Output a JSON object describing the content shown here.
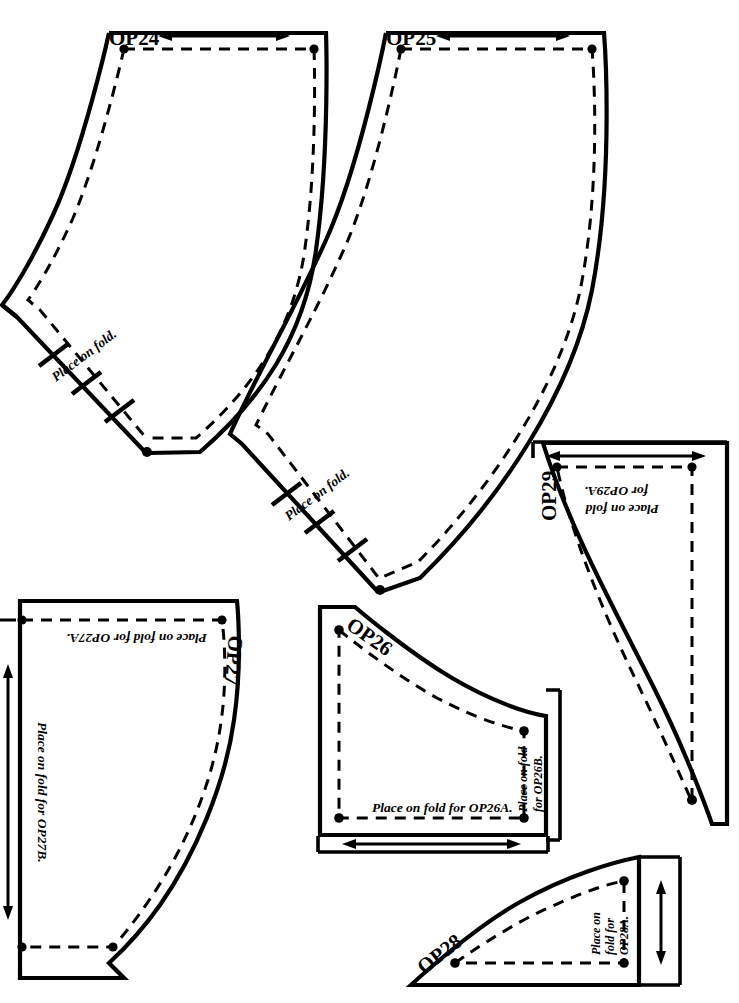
{
  "sheet": {
    "title": "Pattern piece layout sheet",
    "background_color": "#ffffff",
    "ink_color": "#000000",
    "width": 739,
    "height": 1003
  },
  "pieces": [
    {
      "id": "OP24",
      "label": "OP24",
      "fold_note": "Place on fold.",
      "has_grainline_arrow": true,
      "grainline_orientation": "horizontal-double-headed",
      "shape": "curved-sleeve-band"
    },
    {
      "id": "OP25",
      "label": "OP25",
      "fold_note": "Place on fold.",
      "has_grainline_arrow": true,
      "grainline_orientation": "horizontal-double-headed",
      "shape": "curved-sleeve-band"
    },
    {
      "id": "OP26",
      "label": "OP26",
      "fold_note_bottom": "Place on fold for OP26A.",
      "fold_note_right_line1": "Place on fold",
      "fold_note_right_line2": "for OP26B.",
      "has_grainline_arrow": true,
      "grainline_orientation": "horizontal-double-headed",
      "shape": "concave-quarter-panel"
    },
    {
      "id": "OP27",
      "label": "OP27",
      "fold_note_top": "Place on fold for OP27A.",
      "fold_note_left": "Place on fold for OP27B.",
      "has_grainline_arrow": true,
      "grainline_orientation": "vertical-double-headed",
      "shape": "large-concave-panel"
    },
    {
      "id": "OP28",
      "label": "OP28",
      "fold_note_line1": "Place on",
      "fold_note_line2": "fold for",
      "fold_note_line3": "OP28A.",
      "has_grainline_arrow": true,
      "grainline_orientation": "vertical-double-headed",
      "shape": "convex-quarter-wedge"
    },
    {
      "id": "OP29",
      "label": "OP29",
      "fold_note_line1": "Place on fold",
      "fold_note_line2": "for OP29A.",
      "has_grainline_arrow": true,
      "grainline_orientation": "horizontal-double-headed",
      "shape": "curved-gore-panel"
    }
  ]
}
